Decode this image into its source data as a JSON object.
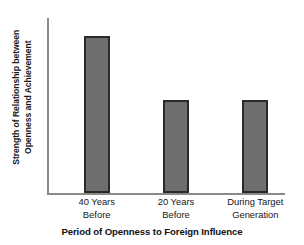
{
  "chart_data": {
    "type": "bar",
    "title": "",
    "xlabel": "Period of Openness to Foreign Influence",
    "ylabel": "Strength of Relationship between Openness and Achievement",
    "ylabel_lines": [
      "Strength of Relationship between",
      "Openness and Achievement"
    ],
    "categories": [
      "40 Years Before",
      "20 Years Before",
      "During Target Generation"
    ],
    "category_lines": [
      [
        "40 Years",
        "Before"
      ],
      [
        "20 Years",
        "Before"
      ],
      [
        "During Target",
        "Generation"
      ]
    ],
    "values": [
      0.89,
      0.53,
      0.53
    ],
    "ylim": [
      0,
      1
    ],
    "y_ticks": [],
    "y_tick_labels": [],
    "grid": false,
    "legend": false,
    "colors": {
      "bar_fill": "#6e6e6e",
      "bar_edge": "#2a2a2a",
      "axis_line": "#8a8a8a",
      "text": "#161616",
      "background": "#ffffff"
    }
  },
  "axis": {
    "y_title_line1": "Strength of Relationship between",
    "y_title_line2": "Openness and Achievement",
    "x_title": "Period of Openness to Foreign Influence"
  },
  "ticks": [
    {
      "line1": "40 Years",
      "line2": "Before"
    },
    {
      "line1": "20 Years",
      "line2": "Before"
    },
    {
      "line1": "During Target",
      "line2": "Generation"
    }
  ]
}
